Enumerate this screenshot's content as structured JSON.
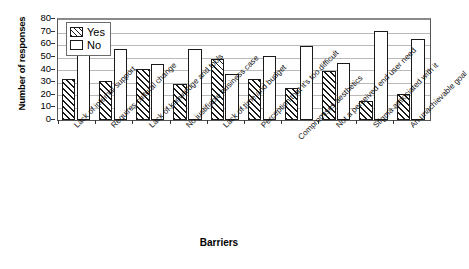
{
  "chart_data": {
    "type": "bar",
    "title": "",
    "xlabel": "Barriers",
    "ylabel": "Number of responses",
    "ylim": [
      0,
      80
    ],
    "yticks": [
      0,
      10,
      20,
      30,
      40,
      50,
      60,
      70,
      80
    ],
    "grid": true,
    "legend_position": "top-left",
    "categories": [
      "Lack of internal support",
      "Requires cultural change",
      "Lack of knowledge and tools",
      "No justifiable business case",
      "Lack of time and budget",
      "Perception that it's too difficult",
      "Compromises aesthetics",
      "Not a perceived end user need",
      "Stigma associated with it",
      "An unachievable goal"
    ],
    "series": [
      {
        "name": "Yes",
        "values": [
          33,
          31,
          41,
          29,
          49,
          33,
          26,
          39,
          15,
          21
        ]
      },
      {
        "name": "No",
        "values": [
          52,
          57,
          45,
          57,
          37,
          51,
          59,
          46,
          71,
          65
        ]
      }
    ]
  },
  "legend": {
    "yes_label": "Yes",
    "no_label": "No"
  },
  "colors": {
    "series_yes": "#1a1a1a",
    "series_no": "#ffffff",
    "grid": "#b9b9b9",
    "axis": "#333333"
  }
}
